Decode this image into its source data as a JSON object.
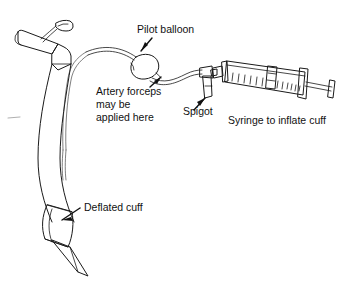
{
  "figure": {
    "title": "Endotracheal tube with pilot balloon, spigot and inflating syringe",
    "background_color": "#ffffff",
    "ink_color": "#1a1a1a",
    "text_color": "#111111",
    "width": 351,
    "height": 282,
    "style": "black-and-white line drawing"
  },
  "labels": {
    "pilot_balloon": "Pilot balloon",
    "artery_forceps_line1": "Artery forceps",
    "artery_forceps_line2": "may be",
    "artery_forceps_line3": "applied here",
    "spigot": "Spigot",
    "syringe": "Syringe to inflate cuff",
    "deflated_cuff": "Deflated cuff"
  },
  "parts": [
    {
      "id": "tube-connector",
      "name": "15 mm connector / adapter",
      "labelled": false
    },
    {
      "id": "tube-shaft",
      "name": "curved endotracheal tube shaft",
      "labelled": false
    },
    {
      "id": "inflation-line",
      "name": "cuff inflation line",
      "labelled": false
    },
    {
      "id": "pilot-balloon",
      "name": "pilot balloon",
      "labelled": true,
      "label": "Pilot balloon"
    },
    {
      "id": "forceps-site",
      "name": "tubing segment for artery forceps",
      "labelled": true,
      "label": "Artery forceps may be applied here"
    },
    {
      "id": "spigot",
      "name": "spigot valve",
      "labelled": true,
      "label": "Spigot"
    },
    {
      "id": "syringe",
      "name": "graduated syringe with plunger",
      "labelled": true,
      "label": "Syringe to inflate cuff"
    },
    {
      "id": "deflated-cuff",
      "name": "deflated cuff",
      "labelled": true,
      "label": "Deflated cuff"
    },
    {
      "id": "bevelled-tip",
      "name": "bevelled distal tip",
      "labelled": false
    }
  ],
  "label_positions": {
    "pilot_balloon": {
      "x": 137,
      "y": 33
    },
    "artery_forceps_line1": {
      "x": 96,
      "y": 95
    },
    "artery_forceps_line2": {
      "x": 96,
      "y": 108
    },
    "artery_forceps_line3": {
      "x": 96,
      "y": 121
    },
    "spigot": {
      "x": 183,
      "y": 115
    },
    "syringe": {
      "x": 228,
      "y": 124
    },
    "deflated_cuff": {
      "x": 84,
      "y": 211
    }
  },
  "syringe_graduations": {
    "count": 13,
    "description": "tick marks along lower edge of syringe barrel"
  }
}
